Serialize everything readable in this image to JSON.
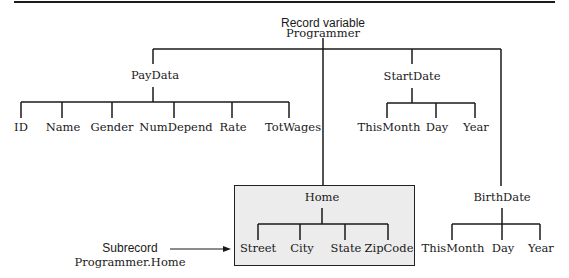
{
  "diagram": {
    "root": {
      "line1": "Record variable",
      "line2": "Programmer"
    },
    "paydata": {
      "label": "PayData",
      "children": [
        "ID",
        "Name",
        "Gender",
        "NumDepend",
        "Rate",
        "TotWages"
      ]
    },
    "startdate": {
      "label": "StartDate",
      "children": [
        "ThisMonth",
        "Day",
        "Year"
      ]
    },
    "home": {
      "label": "Home",
      "children": [
        "Street",
        "City",
        "State",
        "ZipCode"
      ],
      "box_fill": "#ececec"
    },
    "birthdate": {
      "label": "BirthDate",
      "children": [
        "ThisMonth",
        "Day",
        "Year"
      ]
    },
    "annotation": {
      "line1": "Subrecord",
      "line2": "Programmer.Home"
    }
  }
}
